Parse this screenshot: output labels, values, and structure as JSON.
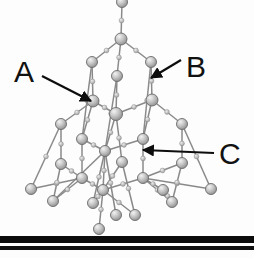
{
  "figure": {
    "kind": "ball-and-stick-crystal-lattice-diagram",
    "background_color": "#fdfdfd",
    "atom_color": "#a8a8a8",
    "atom_highlight_color": "#e8e8e8",
    "atom_edge_color": "#6b6b6b",
    "bond_color": "#8a8a8a",
    "bond_node_color": "#bdbdbd",
    "label_color": "#111111",
    "arrow_color": "#0d0d0d",
    "substrate_color": "#0a0a0a"
  },
  "labels": [
    {
      "id": "A",
      "text": "A",
      "x": 14,
      "y": 57,
      "size": 30,
      "arrow": {
        "x1": 42,
        "y1": 76,
        "x2": 91,
        "y2": 101
      }
    },
    {
      "id": "B",
      "text": "B",
      "x": 186,
      "y": 52,
      "size": 30,
      "arrow": {
        "x1": 181,
        "y1": 60,
        "x2": 151,
        "y2": 78
      }
    },
    {
      "id": "C",
      "text": "C",
      "x": 219,
      "y": 139,
      "size": 30,
      "arrow": {
        "x1": 214,
        "y1": 153,
        "x2": 143,
        "y2": 150
      }
    }
  ],
  "substrate": {
    "name": "substrate-surface",
    "bars": [
      {
        "y": 236,
        "height": 7,
        "color": "#0c0c0c"
      },
      {
        "y": 246,
        "height": 4,
        "color": "#111111"
      }
    ]
  },
  "chart_data": {
    "type": "scatter",
    "title": "",
    "xlabel": "",
    "ylabel": "",
    "atoms": [
      {
        "id": 0,
        "x": 122,
        "y": 2,
        "r": 5.5
      },
      {
        "id": 1,
        "x": 121,
        "y": 39,
        "r": 6.0
      },
      {
        "id": 2,
        "x": 92,
        "y": 62,
        "r": 5.5
      },
      {
        "id": 3,
        "x": 151,
        "y": 62,
        "r": 5.5
      },
      {
        "id": 4,
        "x": 117,
        "y": 76,
        "r": 5.5
      },
      {
        "id": 5,
        "x": 93,
        "y": 101,
        "r": 6.0
      },
      {
        "id": 6,
        "x": 152,
        "y": 100,
        "r": 6.0
      },
      {
        "id": 7,
        "x": 116,
        "y": 114,
        "r": 6.5
      },
      {
        "id": 8,
        "x": 61,
        "y": 124,
        "r": 5.5
      },
      {
        "id": 9,
        "x": 182,
        "y": 124,
        "r": 5.5
      },
      {
        "id": 10,
        "x": 82,
        "y": 139,
        "r": 5.5
      },
      {
        "id": 11,
        "x": 143,
        "y": 139,
        "r": 5.5
      },
      {
        "id": 12,
        "x": 105,
        "y": 151,
        "r": 5.5
      },
      {
        "id": 13,
        "x": 61,
        "y": 164,
        "r": 5.5
      },
      {
        "id": 14,
        "x": 122,
        "y": 162,
        "r": 5.5
      },
      {
        "id": 15,
        "x": 182,
        "y": 163,
        "r": 5.5
      },
      {
        "id": 16,
        "x": 31,
        "y": 189,
        "r": 5.5
      },
      {
        "id": 17,
        "x": 82,
        "y": 178,
        "r": 5.5
      },
      {
        "id": 18,
        "x": 103,
        "y": 190,
        "r": 5.5
      },
      {
        "id": 19,
        "x": 143,
        "y": 178,
        "r": 5.5
      },
      {
        "id": 20,
        "x": 163,
        "y": 190,
        "r": 5.5
      },
      {
        "id": 21,
        "x": 211,
        "y": 189,
        "r": 5.5
      },
      {
        "id": 22,
        "x": 53,
        "y": 201,
        "r": 5.5
      },
      {
        "id": 23,
        "x": 93,
        "y": 203,
        "r": 5.5
      },
      {
        "id": 24,
        "x": 116,
        "y": 215,
        "r": 5.5
      },
      {
        "id": 25,
        "x": 135,
        "y": 215,
        "r": 5.5
      },
      {
        "id": 26,
        "x": 172,
        "y": 202,
        "r": 5.5
      },
      {
        "id": 27,
        "x": 99,
        "y": 229,
        "r": 5.5
      }
    ],
    "bonds": [
      [
        0,
        1
      ],
      [
        1,
        2
      ],
      [
        1,
        3
      ],
      [
        1,
        4
      ],
      [
        2,
        5
      ],
      [
        3,
        6
      ],
      [
        4,
        7
      ],
      [
        5,
        7
      ],
      [
        6,
        7
      ],
      [
        5,
        10
      ],
      [
        6,
        11
      ],
      [
        7,
        12
      ],
      [
        7,
        14
      ],
      [
        5,
        8
      ],
      [
        6,
        9
      ],
      [
        8,
        13
      ],
      [
        9,
        15
      ],
      [
        10,
        12
      ],
      [
        11,
        12
      ],
      [
        10,
        17
      ],
      [
        11,
        19
      ],
      [
        12,
        18
      ],
      [
        12,
        23
      ],
      [
        12,
        24
      ],
      [
        12,
        22
      ],
      [
        13,
        17
      ],
      [
        15,
        19
      ],
      [
        14,
        18
      ],
      [
        14,
        25
      ],
      [
        17,
        16
      ],
      [
        17,
        22
      ],
      [
        17,
        18
      ],
      [
        19,
        20
      ],
      [
        19,
        21
      ],
      [
        19,
        26
      ],
      [
        19,
        18
      ],
      [
        18,
        23
      ],
      [
        18,
        25
      ],
      [
        18,
        27
      ],
      [
        20,
        26
      ],
      [
        13,
        22
      ],
      [
        15,
        26
      ],
      [
        9,
        21
      ],
      [
        8,
        16
      ],
      [
        4,
        12
      ],
      [
        3,
        11
      ],
      [
        2,
        10
      ]
    ]
  }
}
